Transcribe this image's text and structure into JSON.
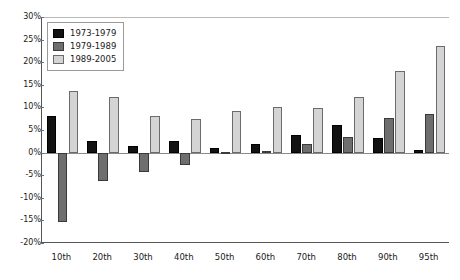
{
  "chart_data": {
    "type": "bar",
    "title": "",
    "subtitle": "",
    "xlabel": "",
    "ylabel": "",
    "ylim": [
      -20,
      30
    ],
    "ytick_labels": [
      "30%",
      "25%",
      "20%",
      "15%",
      "10%",
      "5%",
      "0%",
      "-5%",
      "-10%",
      "-15%",
      "-20%"
    ],
    "ytick_values": [
      30,
      25,
      20,
      15,
      10,
      5,
      0,
      -5,
      -10,
      -15,
      -20
    ],
    "grid": false,
    "legend_position": "top-left",
    "categories": [
      "10th",
      "20th",
      "30th",
      "40th",
      "50th",
      "60th",
      "70th",
      "80th",
      "90th",
      "95th"
    ],
    "series": [
      {
        "name": "1973-1979",
        "color": "#121212",
        "values": [
          8.0,
          2.6,
          1.5,
          2.6,
          1.1,
          1.8,
          4.0,
          6.0,
          3.3,
          0.5
        ]
      },
      {
        "name": "1979-1989",
        "color": "#6e6e6e",
        "values": [
          -15.3,
          -6.3,
          -4.3,
          -2.7,
          0.1,
          0.4,
          2.0,
          3.4,
          7.6,
          8.5
        ]
      },
      {
        "name": "1989-2005",
        "color": "#d4d4d4",
        "values": [
          13.6,
          12.2,
          8.2,
          7.4,
          9.1,
          10.0,
          9.8,
          12.3,
          18.1,
          23.5
        ]
      }
    ]
  }
}
